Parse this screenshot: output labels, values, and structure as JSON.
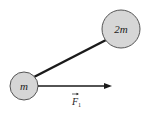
{
  "diagram": {
    "masses": [
      {
        "label": "m",
        "cx": 24,
        "cy": 86,
        "r": 14
      },
      {
        "label": "2m",
        "cx": 121,
        "cy": 29,
        "r": 19
      }
    ],
    "rod": {
      "x1": 34,
      "y1": 77,
      "x2": 106,
      "y2": 40
    },
    "force": {
      "label": "F",
      "subscript": "1",
      "x1": 38,
      "y1": 86,
      "x2": 112,
      "y2": 86
    },
    "colors": {
      "mass_fill": "#d6d6d6",
      "stroke": "#333333",
      "rod": "#1a1a1a"
    }
  }
}
